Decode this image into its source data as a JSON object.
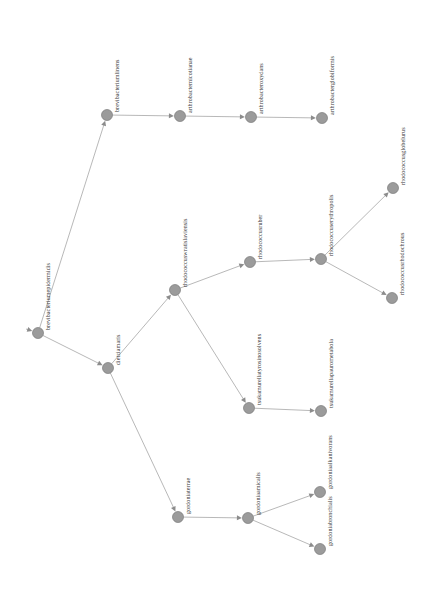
{
  "figure": {
    "type": "directed-graph",
    "orientation": "labels-rotated-90ccw",
    "background_color": "#ffffff",
    "node_color": "#9b9b9b",
    "edge_color": "#b0b0b0",
    "arrow_color": "#8c8c8c",
    "node_radius": 5.5,
    "width": 432,
    "height": 611
  },
  "nodes": [
    {
      "id": "root",
      "label": "brevibacteriumepidermidis",
      "x": 38,
      "y": 333,
      "label_x": 45,
      "label_y": 330
    },
    {
      "id": "brevibacteriumlinens",
      "label": "brevibacteriumlinens",
      "x": 107,
      "y": 115,
      "label_x": 114,
      "label_y": 112
    },
    {
      "id": "arthrobacternicotianae",
      "label": "arthrobacternicotianae",
      "x": 180,
      "y": 116,
      "label_x": 187,
      "label_y": 113
    },
    {
      "id": "arthrobacteroxydans",
      "label": "arthrobacteroxydans",
      "x": 251,
      "y": 117,
      "label_x": 258,
      "label_y": 114
    },
    {
      "id": "arthrobacterglobiformis",
      "label": "arthrobacterglobiformis",
      "x": 322,
      "y": 118,
      "label_x": 329,
      "label_y": 115
    },
    {
      "id": "dietziamaris",
      "label": "dietziamaris",
      "x": 108,
      "y": 368,
      "label_x": 115,
      "label_y": 365
    },
    {
      "id": "rhodococcuswratislaviensis",
      "label": "rhodococcuswratislaviensis",
      "x": 175,
      "y": 290,
      "label_x": 182,
      "label_y": 287
    },
    {
      "id": "rhodococcusruber",
      "label": "rhodococcusruber",
      "x": 250,
      "y": 262,
      "label_x": 257,
      "label_y": 259
    },
    {
      "id": "rhodococcuserythropolis",
      "label": "rhodococcuserythropolis",
      "x": 321,
      "y": 259,
      "label_x": 328,
      "label_y": 256
    },
    {
      "id": "rhodococcusglobelurus",
      "label": "rhodococcusglobelurus",
      "x": 393,
      "y": 188,
      "label_x": 400,
      "label_y": 185
    },
    {
      "id": "rhodococcusrhodochrous",
      "label": "rhodococcusrhodochrous",
      "x": 392,
      "y": 298,
      "label_x": 399,
      "label_y": 295
    },
    {
      "id": "tsukamurellatyrosinosolvens",
      "label": "tsukamurellatyrosinosolvens",
      "x": 249,
      "y": 408,
      "label_x": 256,
      "label_y": 405
    },
    {
      "id": "tsukamurellapaurometabola",
      "label": "tsukamurellapaurometabola",
      "x": 321,
      "y": 411,
      "label_x": 328,
      "label_y": 408
    },
    {
      "id": "gordoniaterrae",
      "label": "gordoniaterrae",
      "x": 178,
      "y": 517,
      "label_x": 185,
      "label_y": 514
    },
    {
      "id": "gordoniaamicalis",
      "label": "gordoniaamicalis",
      "x": 248,
      "y": 518,
      "label_x": 255,
      "label_y": 515
    },
    {
      "id": "gordoniaalkanivorans",
      "label": "gordoniaalkanivorans",
      "x": 320,
      "y": 492,
      "label_x": 327,
      "label_y": 489
    },
    {
      "id": "gordoniabronchialis",
      "label": "gordoniabronchialis",
      "x": 320,
      "y": 549,
      "label_x": 327,
      "label_y": 546
    }
  ],
  "edges": [
    {
      "from": "entry",
      "to": "root"
    },
    {
      "from": "root",
      "to": "brevibacteriumlinens"
    },
    {
      "from": "brevibacteriumlinens",
      "to": "arthrobacternicotianae"
    },
    {
      "from": "arthrobacternicotianae",
      "to": "arthrobacteroxydans"
    },
    {
      "from": "arthrobacteroxydans",
      "to": "arthrobacterglobiformis"
    },
    {
      "from": "root",
      "to": "dietziamaris"
    },
    {
      "from": "dietziamaris",
      "to": "rhodococcuswratislaviensis"
    },
    {
      "from": "rhodococcuswratislaviensis",
      "to": "rhodococcusruber"
    },
    {
      "from": "rhodococcusruber",
      "to": "rhodococcuserythropolis"
    },
    {
      "from": "rhodococcuserythropolis",
      "to": "rhodococcusglobelurus"
    },
    {
      "from": "rhodococcuserythropolis",
      "to": "rhodococcusrhodochrous"
    },
    {
      "from": "rhodococcuswratislaviensis",
      "to": "tsukamurellatyrosinosolvens"
    },
    {
      "from": "tsukamurellatyrosinosolvens",
      "to": "tsukamurellapaurometabola"
    },
    {
      "from": "dietziamaris",
      "to": "gordoniaterrae"
    },
    {
      "from": "gordoniaterrae",
      "to": "gordoniaamicalis"
    },
    {
      "from": "gordoniaamicalis",
      "to": "gordoniaalkanivorans"
    },
    {
      "from": "gordoniaamicalis",
      "to": "gordoniabronchialis"
    }
  ],
  "entry_marker": {
    "x": 26,
    "y": 329
  }
}
